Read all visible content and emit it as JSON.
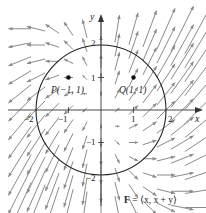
{
  "diagram": {
    "field_label": "F = ⟨x, x + y⟩",
    "field_label_bold": "F",
    "field_label_rest": " = ⟨x, x + y⟩",
    "axis_x_label": "x",
    "axis_y_label": "y",
    "x_ticks": [
      "−2",
      "−1",
      "1",
      "2"
    ],
    "y_ticks": [
      "2",
      "1",
      "−1",
      "−2"
    ],
    "circle": {
      "center": [
        0,
        0
      ],
      "radius": 2
    },
    "points": [
      {
        "name": "P",
        "label": "P(−1, 1)",
        "x": -1,
        "y": 1
      },
      {
        "name": "Q",
        "label": "Q(1, 1)",
        "x": 1,
        "y": 1
      }
    ],
    "vector_field": {
      "expression": "F(x, y) = ⟨x, x + y⟩",
      "grid_step": 0.5,
      "x_range": [
        -3,
        3
      ],
      "y_range": [
        -3,
        3
      ],
      "arrow_scale": 0.28,
      "arrow_color": "#8a8a8a"
    },
    "colors": {
      "axis": "#333333",
      "circle": "#222222",
      "point": "#111111"
    }
  }
}
